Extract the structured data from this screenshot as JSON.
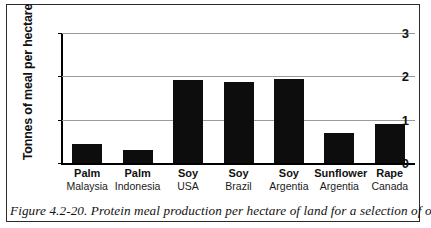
{
  "figure": {
    "caption": "Figure 4.2-20. Protein meal production per hectare of land for a selection of oil-"
  },
  "chart_data": {
    "type": "bar",
    "title": "",
    "xlabel": "",
    "ylabel": "Tonnes of meal per hectare",
    "ylim": [
      0,
      3
    ],
    "yticks": [
      0,
      1,
      2,
      3
    ],
    "ytick_labels": [
      "0",
      "1",
      "2",
      "3"
    ],
    "grid": true,
    "legend": "none",
    "bar_color": "#0d0d0d",
    "categories": [
      "Palm Malaysia",
      "Palm Indonesia",
      "Soy USA",
      "Soy Brazil",
      "Soy Argentia",
      "Sunflower Argentia",
      "Rape Canada"
    ],
    "crop_names": [
      "Palm",
      "Palm",
      "Soy",
      "Soy",
      "Soy",
      "Sunflower",
      "Rape"
    ],
    "regions": [
      "Malaysia",
      "Indonesia",
      "USA",
      "Brazil",
      "Argentia",
      "Argentia",
      "Canada"
    ],
    "values": [
      0.45,
      0.3,
      1.92,
      1.88,
      1.95,
      0.7,
      0.9
    ]
  }
}
